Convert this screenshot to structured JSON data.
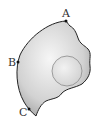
{
  "diagram": {
    "points": [
      {
        "label": "A",
        "x": 66,
        "y": 21
      },
      {
        "label": "B",
        "x": 18,
        "y": 62
      },
      {
        "label": "C",
        "x": 29,
        "y": 109
      }
    ],
    "hole": {
      "cx": 67,
      "cy": 71,
      "r": 15
    },
    "colors": {
      "outline": "#222222",
      "fill_light": "#f4f4f4",
      "fill_dark": "#b9b9b9",
      "hole_stroke": "#8a8a8a",
      "label": "#333333"
    }
  }
}
